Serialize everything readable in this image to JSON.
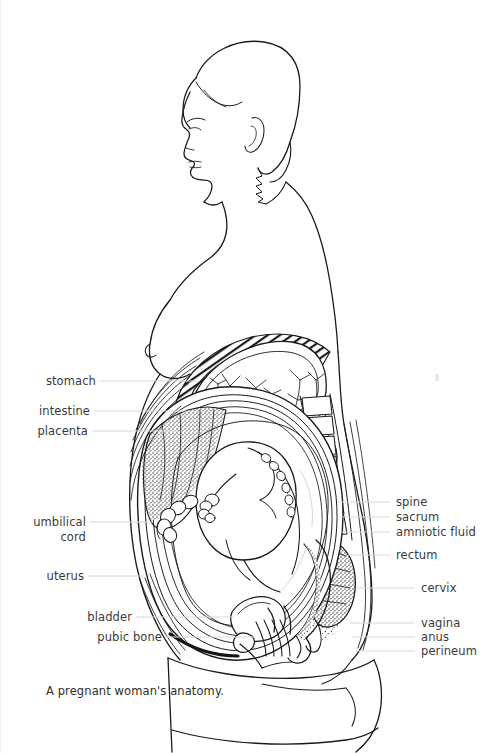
{
  "figure": {
    "title": "A pregnant woman's anatomy.",
    "caption": "A pregnant woman's anatomy.",
    "style": "black-and-white line drawing, cross-sectional side view",
    "ink_color": "#1a1a1a",
    "background_color": "#ffffff",
    "label_color": "#3a3a3a",
    "leader_color": "#d8d8d8"
  },
  "labels_left": [
    {
      "id": "stomach",
      "text": "stomach",
      "x": 35,
      "y": 375,
      "leader_x1": 100,
      "leader_x2": 196,
      "leader_y": 381
    },
    {
      "id": "intestine",
      "text": "intestine",
      "x": 36,
      "y": 405,
      "leader_x1": 94,
      "leader_x2": 182,
      "leader_y": 411
    },
    {
      "id": "placenta",
      "text": "placenta",
      "x": 26,
      "y": 425,
      "leader_x1": 92,
      "leader_x2": 176,
      "leader_y": 431
    },
    {
      "id": "umbilical-cord",
      "text": "umbilical\ncord",
      "line1": "umbilical",
      "line2": "cord",
      "x": 22,
      "y": 515,
      "leader_x1": 90,
      "leader_x2": 150,
      "leader_y": 522
    },
    {
      "id": "uterus",
      "text": "uterus",
      "x": 38,
      "y": 570,
      "leader_x1": 88,
      "leader_x2": 142,
      "leader_y": 576
    },
    {
      "id": "bladder",
      "text": "bladder",
      "x": 82,
      "y": 611,
      "leader_x1": 136,
      "leader_x2": 232,
      "leader_y": 617
    },
    {
      "id": "pubic-bone",
      "text": "pubic bone",
      "x": 94,
      "y": 631,
      "leader_x1": 166,
      "leader_x2": 252,
      "leader_y": 637
    }
  ],
  "labels_right": [
    {
      "id": "spine",
      "text": "spine",
      "x": 396,
      "y": 496,
      "leader_x1": 340,
      "leader_x2": 390,
      "leader_y": 502
    },
    {
      "id": "sacrum",
      "text": "sacrum",
      "x": 396,
      "y": 511,
      "leader_x1": 340,
      "leader_x2": 390,
      "leader_y": 517
    },
    {
      "id": "amniotic-fluid",
      "text": "amniotic fluid",
      "x": 396,
      "y": 526,
      "leader_x1": 340,
      "leader_x2": 390,
      "leader_y": 532
    },
    {
      "id": "rectum",
      "text": "rectum",
      "x": 396,
      "y": 549,
      "leader_x1": 340,
      "leader_x2": 390,
      "leader_y": 555
    },
    {
      "id": "cervix",
      "text": "cervix",
      "x": 421,
      "y": 582,
      "leader_x1": 355,
      "leader_x2": 415,
      "leader_y": 588
    },
    {
      "id": "vagina",
      "text": "vagina",
      "x": 421,
      "y": 617,
      "leader_x1": 355,
      "leader_x2": 415,
      "leader_y": 623
    },
    {
      "id": "anus",
      "text": "anus",
      "x": 421,
      "y": 631,
      "leader_x1": 355,
      "leader_x2": 415,
      "leader_y": 637
    },
    {
      "id": "perineum",
      "text": "perineum",
      "x": 421,
      "y": 645,
      "leader_x1": 355,
      "leader_x2": 415,
      "leader_y": 651
    }
  ],
  "anatomy_parts": [
    "head in profile",
    "bobbed hair",
    "ear",
    "neck",
    "shoulder",
    "breast",
    "ribcage",
    "stomach",
    "intestine",
    "placenta",
    "uterus",
    "amniotic fluid",
    "fetus",
    "umbilical cord",
    "spine",
    "sacrum",
    "rectum",
    "cervix",
    "bladder",
    "pubic bone",
    "vagina",
    "anus",
    "perineum",
    "thigh"
  ]
}
